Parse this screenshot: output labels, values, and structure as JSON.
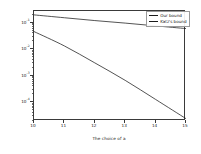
{
  "chart_data": {
    "type": "line",
    "title": "",
    "xlabel": "The choice of a",
    "ylabel": "The tail bound",
    "xlim": [
      10,
      15
    ],
    "ylim": [
      2e-05,
      0.28
    ],
    "yscale": "log",
    "xscale": "linear",
    "grid": false,
    "legend_position": "upper right",
    "xticks": [
      "10",
      "11",
      "12",
      "13",
      "14",
      "15"
    ],
    "xtick_values": [
      10,
      11,
      12,
      13,
      14,
      15
    ],
    "ytick_labels": [
      "10",
      "10",
      "10",
      "10"
    ],
    "ytick_exponents": [
      "-1",
      "-2",
      "-3",
      "-4"
    ],
    "ytick_values": [
      0.1,
      0.01,
      0.001,
      0.0001
    ],
    "x": [
      10,
      11,
      12,
      13,
      14,
      15
    ],
    "series": [
      {
        "name": "Our bound",
        "color": "#1b1b1b",
        "values": [
          0.047,
          0.0135,
          0.0031,
          0.00068,
          0.00013,
          2.45e-05
        ]
      },
      {
        "name": "Katz's bound",
        "color": "#1b1b1b",
        "values": [
          0.2,
          0.156,
          0.122,
          0.098,
          0.077,
          0.061
        ]
      }
    ]
  },
  "legend": {
    "entries": [
      {
        "label": "Our bound"
      },
      {
        "label": "Katz's bound"
      }
    ]
  },
  "axes": {
    "x_title": "The choice of a",
    "y_title": "The tail bound"
  }
}
